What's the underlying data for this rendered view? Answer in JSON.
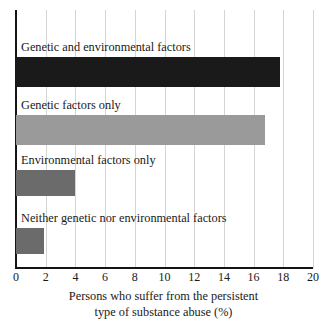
{
  "chart_data": {
    "type": "bar",
    "orientation": "horizontal",
    "title": "",
    "xlabel": "Persons who suffer from the persistent type of substance abuse (%)",
    "ylabel": "",
    "xlim": [
      0,
      20
    ],
    "ylim": null,
    "grid": "vertical gridlines at every x tick",
    "legend": "none",
    "categories": [
      "Genetic and environmental factors",
      "Genetic factors only",
      "Environmental factors only",
      "Neither genetic nor environmental factors"
    ],
    "values": [
      17.8,
      16.8,
      4.0,
      1.9
    ],
    "bar_colors": [
      "#1a1a1a",
      "#9a9a9a",
      "#6b6b6b",
      "#6b6b6b"
    ],
    "xticks": [
      0,
      2,
      4,
      6,
      8,
      10,
      12,
      14,
      16,
      18,
      20
    ],
    "xtick_labels": [
      "0",
      "2",
      "4",
      "6",
      "8",
      "10",
      "12",
      "14",
      "16",
      "18",
      "20"
    ]
  },
  "axis": {
    "x_title_line1": "Persons who suffer from the persistent",
    "x_title_line2": "type of substance abuse (%)",
    "axis_color": "#141414",
    "grid_color": "#d4d4d4"
  }
}
